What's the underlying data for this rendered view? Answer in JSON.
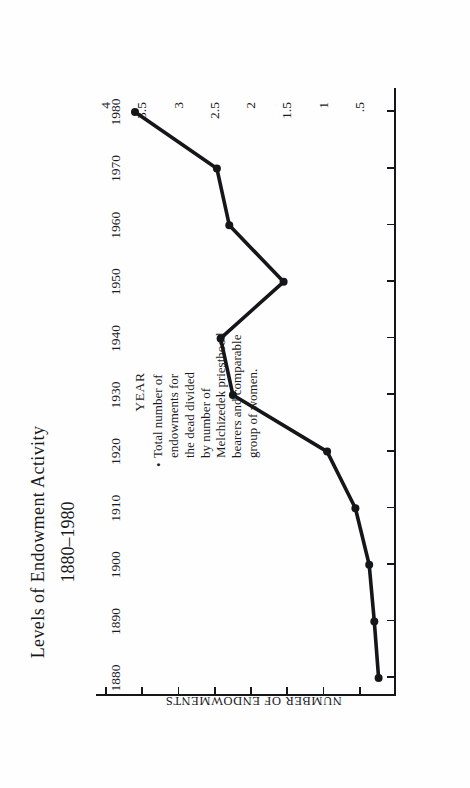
{
  "page": {
    "background": "#ffffff",
    "ink": "#15161a",
    "orientation": "rotated-90-ccw"
  },
  "chart_data": {
    "type": "line",
    "title": "Levels of Endowment Activity",
    "subtitle": "1880–1980",
    "xlabel": "YEAR",
    "ylabel": "NUMBER OF ENDOWMENTS",
    "xlim": [
      1880,
      1980
    ],
    "ylim": [
      0,
      4
    ],
    "grid": false,
    "legend": null,
    "markers": "filled-circle",
    "line_color": "#15161a",
    "x": [
      1880,
      1890,
      1900,
      1910,
      1920,
      1930,
      1940,
      1950,
      1960,
      1970,
      1980
    ],
    "xticklabels": [
      "1880",
      "1890",
      "1900",
      "1910",
      "1920",
      "1930",
      "1940",
      "1950",
      "1960",
      "1970",
      "1980"
    ],
    "yticks": [
      4,
      3.5,
      3,
      2.5,
      2,
      1.5,
      1,
      0.5
    ],
    "yticklabels": [
      "4",
      "3.5",
      "3",
      "2.5",
      "2",
      "1.5",
      "1",
      ".5"
    ],
    "values": [
      0.24,
      0.3,
      0.37,
      0.56,
      0.95,
      2.25,
      2.42,
      1.55,
      2.3,
      2.47,
      3.6
    ],
    "series": [
      {
        "name": "Endowments per Melchizedek priesthood bearer",
        "values": [
          0.24,
          0.3,
          0.37,
          0.56,
          0.95,
          2.25,
          2.42,
          1.55,
          2.3,
          2.47,
          3.6
        ]
      }
    ],
    "annotation": {
      "bullet": "•",
      "lines": [
        "Total number of",
        "endowments for",
        "the dead divided",
        "by number of",
        "Melchizedek priesthood",
        "bearers and comparable",
        "group of women."
      ],
      "text": "Total number of endowments for the dead divided by number of Melchizedek priesthood bearers and comparable group of women."
    }
  }
}
